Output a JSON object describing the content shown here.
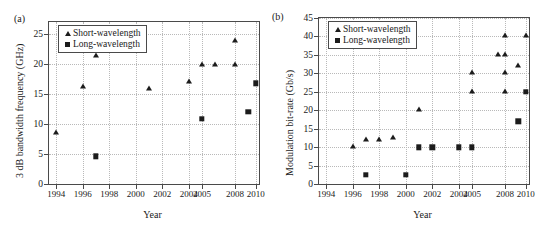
{
  "figure": {
    "background": "#ffffff",
    "marker_color": "#1c1c1c",
    "axis_color": "#4a4a4a",
    "grid_color": "#b9b9b9"
  },
  "panels": [
    {
      "label": "(a)",
      "legend": {
        "items": [
          {
            "symbol": "triangle",
            "label": "Short-wavelength"
          },
          {
            "symbol": "square",
            "label": "Long-wavelength"
          }
        ]
      },
      "chart_data": {
        "type": "scatter",
        "title": "",
        "xlabel": "Year",
        "ylabel": "3 dB bandwidth frequency (GHz)",
        "xticklabels": [
          "1994",
          "1996",
          "1998",
          "2000",
          "2002",
          "2004",
          "2005",
          "2008",
          "2010"
        ],
        "yticklabels": [
          "0",
          "5",
          "10",
          "15",
          "20",
          "25"
        ],
        "yticks": [
          0,
          5,
          10,
          15,
          20,
          25
        ],
        "ylim": [
          0,
          27
        ],
        "grid": true,
        "legend_position": "top-left",
        "series": [
          {
            "name": "Short-wavelength",
            "marker": "triangle",
            "points": [
              {
                "x": "1994",
                "y": 8.5
              },
              {
                "x": "1996",
                "y": 16.2
              },
              {
                "x": "1997",
                "y": 21.3
              },
              {
                "x": "2001",
                "y": 15.9
              },
              {
                "x": "2004",
                "y": 17.0
              },
              {
                "x": "2005",
                "y": 19.9
              },
              {
                "x": "2006",
                "y": 19.9
              },
              {
                "x": "2008",
                "y": 23.8
              },
              {
                "x": "2008",
                "y": 19.9
              }
            ]
          },
          {
            "name": "Long-wavelength",
            "marker": "square",
            "points": [
              {
                "x": "1997",
                "y": 4.6
              },
              {
                "x": "2005",
                "y": 10.9
              },
              {
                "x": "2009",
                "y": 12.0
              },
              {
                "x": "2010",
                "y": 16.8
              }
            ]
          }
        ]
      }
    },
    {
      "label": "(b)",
      "legend": {
        "items": [
          {
            "symbol": "triangle",
            "label": "Short-wavelength"
          },
          {
            "symbol": "square",
            "label": "Long-wavelength"
          }
        ]
      },
      "chart_data": {
        "type": "scatter",
        "title": "",
        "xlabel": "Year",
        "ylabel": "Modulation bit-rate (Gb/s)",
        "xticklabels": [
          "1994",
          "1996",
          "1998",
          "2000",
          "2002",
          "2004",
          "2005",
          "2008",
          "2010"
        ],
        "yticklabels": [
          "0",
          "5",
          "10",
          "15",
          "20",
          "25",
          "30",
          "35",
          "40",
          "45"
        ],
        "yticks": [
          0,
          5,
          10,
          15,
          20,
          25,
          30,
          35,
          40,
          45
        ],
        "ylim": [
          0,
          45
        ],
        "grid": true,
        "legend_position": "top-left",
        "series": [
          {
            "name": "Short-wavelength",
            "marker": "triangle",
            "points": [
              {
                "x": "1996",
                "y": 10
              },
              {
                "x": "1997",
                "y": 12
              },
              {
                "x": "1998",
                "y": 12
              },
              {
                "x": "1999",
                "y": 12.5
              },
              {
                "x": "2001",
                "y": 20
              },
              {
                "x": "2005",
                "y": 25
              },
              {
                "x": "2005",
                "y": 30
              },
              {
                "x": "2007",
                "y": 35
              },
              {
                "x": "2008",
                "y": 25
              },
              {
                "x": "2008",
                "y": 30
              },
              {
                "x": "2008",
                "y": 35
              },
              {
                "x": "2008",
                "y": 40
              },
              {
                "x": "2009",
                "y": 32
              },
              {
                "x": "2010",
                "y": 40
              }
            ]
          },
          {
            "name": "Long-wavelength",
            "marker": "square",
            "points": [
              {
                "x": "1997",
                "y": 2.5
              },
              {
                "x": "2000",
                "y": 2.5
              },
              {
                "x": "2001",
                "y": 10
              },
              {
                "x": "2002",
                "y": 10
              },
              {
                "x": "2004",
                "y": 10
              },
              {
                "x": "2005",
                "y": 10
              },
              {
                "x": "2009",
                "y": 17
              },
              {
                "x": "2010",
                "y": 25
              }
            ]
          }
        ]
      }
    }
  ]
}
